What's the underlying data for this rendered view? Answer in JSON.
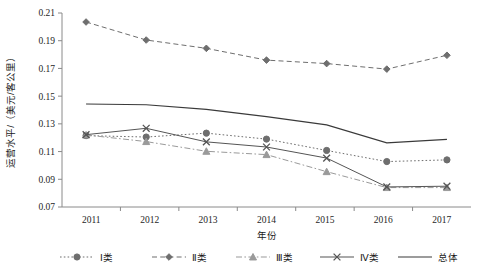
{
  "chart_data": {
    "type": "line",
    "title": "",
    "xlabel": "年份",
    "ylabel": "运营水平/（美元/客公里）",
    "categories": [
      "2011",
      "2012",
      "2013",
      "2014",
      "2015",
      "2016",
      "2017"
    ],
    "x": [
      2011,
      2012,
      2013,
      2014,
      2015,
      2016,
      2017
    ],
    "xlim": [
      2010.6,
      2017.4
    ],
    "ylim": [
      0.07,
      0.21
    ],
    "yticks": [
      "0.07",
      "0.09",
      "0.11",
      "0.13",
      "0.15",
      "0.17",
      "0.19",
      "0.21"
    ],
    "ytick_values": [
      0.07,
      0.09,
      0.11,
      0.13,
      0.15,
      0.17,
      0.19,
      0.21
    ],
    "grid": false,
    "legend_position": "bottom",
    "series": [
      {
        "name": "Ⅰ类",
        "marker": "circle",
        "dash": "dotted",
        "color": "#6e6e6e",
        "values": [
          0.1215,
          0.1205,
          0.1233,
          0.119,
          0.1108,
          0.1028,
          0.104
        ]
      },
      {
        "name": "Ⅱ类",
        "marker": "diamond",
        "dash": "dashed",
        "color": "#6e6e6e",
        "values": [
          0.2035,
          0.1905,
          0.1845,
          0.176,
          0.1735,
          0.1695,
          0.1795
        ]
      },
      {
        "name": "Ⅲ类",
        "marker": "triangle",
        "dash": "dash-dot",
        "color": "#9a9a9a",
        "values": [
          0.122,
          0.1172,
          0.1102,
          0.1078,
          0.0955,
          0.084,
          0.084
        ]
      },
      {
        "name": "Ⅳ类",
        "marker": "cross",
        "dash": "solid",
        "color": "#555555",
        "values": [
          0.1222,
          0.1268,
          0.117,
          0.1133,
          0.1053,
          0.0845,
          0.085
        ]
      },
      {
        "name": "总体",
        "marker": "none",
        "dash": "solid",
        "color": "#3a3a3a",
        "values": [
          0.1443,
          0.1438,
          0.1405,
          0.1352,
          0.1293,
          0.1163,
          0.1188
        ]
      }
    ]
  }
}
